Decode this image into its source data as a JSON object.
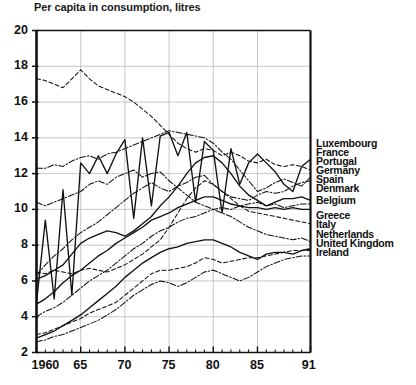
{
  "chart_data": {
    "type": "line",
    "title": "Per capita in consumption, litres",
    "xlabel": "",
    "ylabel": "",
    "xlim": [
      1960,
      1991
    ],
    "ylim": [
      2,
      20
    ],
    "ytick_values": [
      2,
      4,
      6,
      8,
      10,
      12,
      14,
      16,
      18,
      20
    ],
    "ytick_labels": [
      "2",
      "4",
      "6",
      "8",
      "10",
      "12",
      "14",
      "16",
      "18",
      "20"
    ],
    "xtick_values": [
      1960,
      1965,
      1970,
      1975,
      1980,
      1985,
      1991
    ],
    "xtick_labels": [
      "1960",
      "65",
      "70",
      "75",
      "80",
      "85",
      "91"
    ],
    "grid": true,
    "grid_axis": "both",
    "legend_position": "right-outside",
    "x": [
      1960,
      1961,
      1962,
      1963,
      1964,
      1965,
      1966,
      1967,
      1968,
      1969,
      1970,
      1971,
      1972,
      1973,
      1974,
      1975,
      1976,
      1977,
      1978,
      1979,
      1980,
      1981,
      1982,
      1983,
      1984,
      1985,
      1986,
      1987,
      1988,
      1989,
      1990,
      1991
    ],
    "series": [
      {
        "name": "Luxembourg",
        "dash": "solid",
        "values": [
          4.8,
          9.4,
          5.0,
          11.1,
          5.2,
          12.6,
          12.0,
          13.0,
          12.0,
          13.1,
          13.9,
          9.5,
          14.0,
          10.2,
          14.1,
          14.3,
          13.0,
          14.3,
          10.4,
          13.8,
          13.3,
          9.8,
          13.4,
          11.4,
          12.6,
          13.1,
          12.6,
          12.1,
          11.4,
          11.0,
          12.4,
          12.8
        ]
      },
      {
        "name": "France",
        "dash": "dashed",
        "values": [
          17.3,
          17.2,
          17.0,
          16.8,
          17.3,
          17.8,
          17.3,
          16.9,
          16.7,
          16.5,
          16.3,
          16.0,
          15.6,
          15.2,
          14.7,
          14.2,
          13.7,
          13.4,
          13.2,
          13.4,
          13.3,
          13.0,
          13.2,
          13.0,
          12.7,
          12.6,
          12.8,
          12.5,
          12.4,
          12.5,
          12.4,
          12.2
        ]
      },
      {
        "name": "Portugal",
        "dash": "dashdot",
        "values": [
          12.3,
          12.3,
          12.5,
          12.4,
          12.7,
          12.9,
          13.0,
          12.8,
          13.1,
          13.2,
          13.4,
          13.6,
          13.8,
          14.0,
          14.2,
          14.4,
          14.3,
          14.2,
          14.1,
          14.0,
          13.7,
          13.2,
          12.8,
          12.2,
          11.6,
          11.0,
          11.2,
          11.5,
          11.7,
          11.5,
          11.3,
          11.8
        ]
      },
      {
        "name": "Germany",
        "dash": "dashdot",
        "values": [
          6.3,
          6.9,
          7.4,
          7.8,
          8.3,
          8.7,
          9.0,
          9.3,
          9.7,
          10.1,
          10.5,
          10.9,
          11.2,
          11.5,
          11.2,
          11.0,
          11.3,
          11.5,
          11.8,
          11.9,
          11.4,
          11.0,
          10.7,
          10.6,
          10.5,
          10.8,
          11.0,
          10.9,
          11.0,
          11.3,
          11.5,
          11.6
        ]
      },
      {
        "name": "Spain",
        "dash": "solid",
        "values": [
          6.1,
          6.3,
          6.6,
          6.9,
          7.5,
          8.1,
          8.4,
          8.6,
          8.8,
          8.7,
          8.5,
          8.8,
          9.2,
          9.6,
          10.2,
          10.7,
          11.3,
          12.0,
          12.6,
          12.9,
          13.0,
          12.6,
          12.0,
          11.3,
          10.8,
          10.5,
          10.2,
          10.4,
          10.6,
          10.6,
          10.7,
          10.5
        ]
      },
      {
        "name": "Denmark",
        "dash": "dashdot",
        "values": [
          4.0,
          4.3,
          4.5,
          4.8,
          5.2,
          5.6,
          6.0,
          6.3,
          6.6,
          7.0,
          7.4,
          7.8,
          8.1,
          8.5,
          8.8,
          9.0,
          9.3,
          9.5,
          9.6,
          9.8,
          10.0,
          10.1,
          10.0,
          10.2,
          10.3,
          10.4,
          10.2,
          10.3,
          10.1,
          10.2,
          10.3,
          10.3
        ]
      },
      {
        "name": "Belgium",
        "dash": "solid",
        "values": [
          4.7,
          5.0,
          5.4,
          5.9,
          6.3,
          6.6,
          7.0,
          7.4,
          7.7,
          8.1,
          8.4,
          8.7,
          9.0,
          9.4,
          9.6,
          9.8,
          10.1,
          10.3,
          10.5,
          10.7,
          10.7,
          10.5,
          10.3,
          10.2,
          10.1,
          10.1,
          10.0,
          10.1,
          10.0,
          10.1,
          10.0,
          10.0
        ]
      },
      {
        "name": "Greece",
        "dash": "dashed",
        "values": [
          6.5,
          6.4,
          6.6,
          6.5,
          6.4,
          6.6,
          6.7,
          6.6,
          6.5,
          6.7,
          6.9,
          7.2,
          7.5,
          7.9,
          8.3,
          9.0,
          9.8,
          10.6,
          11.2,
          11.6,
          11.4,
          11.0,
          10.6,
          10.2,
          9.9,
          9.8,
          9.7,
          9.6,
          9.5,
          9.4,
          9.3,
          9.2
        ]
      },
      {
        "name": "Italy",
        "dash": "dashdot",
        "values": [
          10.4,
          10.2,
          10.4,
          10.6,
          10.8,
          11.0,
          11.4,
          11.6,
          11.4,
          11.8,
          12.0,
          12.2,
          11.8,
          12.0,
          12.1,
          11.6,
          11.2,
          10.8,
          10.4,
          10.2,
          10.0,
          9.8,
          9.6,
          9.3,
          9.0,
          8.8,
          8.6,
          8.5,
          8.4,
          8.3,
          8.4,
          8.2
        ]
      },
      {
        "name": "Netherlands",
        "dash": "solid",
        "values": [
          2.8,
          3.0,
          3.2,
          3.5,
          3.8,
          4.1,
          4.5,
          4.9,
          5.3,
          5.7,
          6.2,
          6.6,
          7.0,
          7.3,
          7.6,
          7.8,
          7.9,
          8.1,
          8.2,
          8.3,
          8.3,
          8.1,
          7.9,
          7.6,
          7.4,
          7.2,
          7.5,
          7.6,
          7.6,
          7.5,
          7.7,
          7.8
        ]
      },
      {
        "name": "United Kingdom",
        "dash": "dashed",
        "values": [
          3.0,
          3.1,
          3.3,
          3.5,
          3.7,
          3.9,
          4.2,
          4.4,
          4.6,
          4.8,
          5.2,
          5.6,
          6.0,
          6.4,
          6.6,
          6.6,
          6.7,
          6.8,
          7.0,
          7.3,
          7.2,
          7.0,
          7.1,
          7.2,
          7.3,
          7.3,
          7.4,
          7.5,
          7.6,
          7.7,
          7.7,
          7.7
        ]
      },
      {
        "name": "Ireland",
        "dash": "dashdot",
        "values": [
          2.6,
          2.7,
          2.9,
          3.0,
          3.2,
          3.4,
          3.6,
          3.8,
          4.1,
          4.4,
          4.8,
          5.2,
          5.5,
          5.8,
          6.0,
          5.9,
          5.7,
          5.9,
          6.2,
          6.5,
          6.6,
          6.4,
          6.2,
          6.0,
          6.2,
          6.5,
          6.8,
          7.0,
          7.2,
          7.3,
          7.4,
          7.4
        ]
      }
    ]
  },
  "legend": {
    "items": [
      {
        "label": "Luxembourg",
        "top": 0
      },
      {
        "label": "France",
        "top": 9
      },
      {
        "label": "Portugal",
        "top": 18
      },
      {
        "label": "Germany",
        "top": 27
      },
      {
        "label": "Spain",
        "top": 36
      },
      {
        "label": "Denmark",
        "top": 45
      },
      {
        "label": "Belgium",
        "top": 57
      },
      {
        "label": "Greece",
        "top": 72
      },
      {
        "label": "Italy",
        "top": 81
      },
      {
        "label": "Netherlands",
        "top": 91
      },
      {
        "label": "United Kingdom",
        "top": 100
      },
      {
        "label": "Ireland",
        "top": 109
      }
    ]
  }
}
